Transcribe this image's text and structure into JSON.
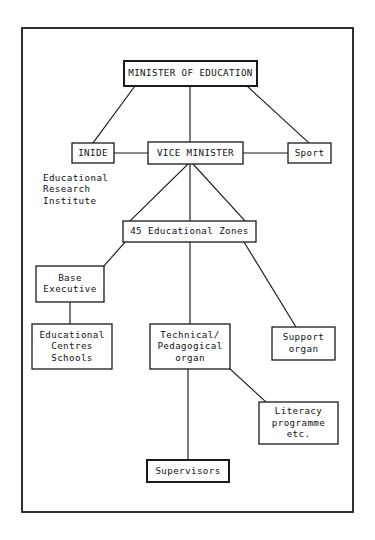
{
  "diagram": {
    "frame": {
      "x": 22,
      "y": 28,
      "width": 331,
      "height": 484
    },
    "colors": {
      "background": "#ffffff",
      "line": "#1a1a1a",
      "text": "#111111",
      "box_fill": "#ffffff"
    },
    "nodes": [
      {
        "id": "minister",
        "name": "minister-of-education",
        "lines": [
          "MINISTER OF EDUCATION"
        ],
        "box": {
          "x": 124,
          "y": 61,
          "width": 133,
          "height": 25
        },
        "weight": "heavy"
      },
      {
        "id": "inide",
        "name": "inide",
        "lines": [
          "INIDE"
        ],
        "box": {
          "x": 72,
          "y": 143,
          "width": 42,
          "height": 20
        },
        "weight": "normal"
      },
      {
        "id": "vice-minister",
        "name": "vice-minister",
        "lines": [
          "VICE MINISTER"
        ],
        "box": {
          "x": 148,
          "y": 142,
          "width": 95,
          "height": 22
        },
        "weight": "normal"
      },
      {
        "id": "sport",
        "name": "sport",
        "lines": [
          "Sport"
        ],
        "box": {
          "x": 288,
          "y": 143,
          "width": 43,
          "height": 20
        },
        "weight": "normal"
      },
      {
        "id": "zones",
        "name": "educational-zones",
        "lines": [
          "45 Educational Zones"
        ],
        "box": {
          "x": 123,
          "y": 221,
          "width": 133,
          "height": 21
        },
        "weight": "normal"
      },
      {
        "id": "base-executive",
        "name": "base-executive",
        "lines": [
          "Base",
          "Executive"
        ],
        "box": {
          "x": 36,
          "y": 266,
          "width": 68,
          "height": 36
        },
        "weight": "normal"
      },
      {
        "id": "educational-centres",
        "name": "educational-centres-schools",
        "lines": [
          "Educational",
          "Centres",
          "Schools"
        ],
        "box": {
          "x": 32,
          "y": 324,
          "width": 80,
          "height": 45
        },
        "weight": "normal"
      },
      {
        "id": "technical-pedagogical",
        "name": "technical-pedagogical-organ",
        "lines": [
          "Technical/",
          "Pedagogical",
          "organ"
        ],
        "box": {
          "x": 150,
          "y": 324,
          "width": 80,
          "height": 45
        },
        "weight": "normal"
      },
      {
        "id": "support-organ",
        "name": "support-organ",
        "lines": [
          "Support",
          "organ"
        ],
        "box": {
          "x": 272,
          "y": 327,
          "width": 63,
          "height": 33
        },
        "weight": "normal"
      },
      {
        "id": "literacy",
        "name": "literacy-programme",
        "lines": [
          "Literacy",
          "programme",
          "etc."
        ],
        "box": {
          "x": 259,
          "y": 402,
          "width": 79,
          "height": 42
        },
        "weight": "normal"
      },
      {
        "id": "supervisors",
        "name": "supervisors",
        "lines": [
          "Supervisors"
        ],
        "box": {
          "x": 147,
          "y": 460,
          "width": 82,
          "height": 22
        },
        "weight": "heavy"
      }
    ],
    "captions": [
      {
        "id": "inide-caption",
        "name": "inide-expansion-caption",
        "lines": [
          "Educational",
          "Research",
          "Institute"
        ],
        "x": 43,
        "y": 178
      }
    ],
    "connectors": [
      {
        "id": "minister-inide",
        "name": "connector-minister-to-inide",
        "points": "[[135,86],[93,143]]"
      },
      {
        "id": "minister-vice",
        "name": "connector-minister-to-vice-minister",
        "points": "[[190,86],[190,142]]"
      },
      {
        "id": "minister-sport",
        "name": "connector-minister-to-sport",
        "points": "[[247,86],[309,143]]"
      },
      {
        "id": "inide-vice",
        "name": "connector-inide-to-vice-minister",
        "points": "[[114,153],[148,153]]"
      },
      {
        "id": "vice-sport",
        "name": "connector-vice-minister-to-sport",
        "points": "[[243,153],[288,153]]"
      },
      {
        "id": "vice-zones-left",
        "name": "connector-vice-minister-to-zones-left",
        "points": "[[188,164],[130,221]]"
      },
      {
        "id": "vice-zones-mid",
        "name": "connector-vice-minister-to-zones-center",
        "points": "[[190,164],[190,221]]"
      },
      {
        "id": "vice-zones-right",
        "name": "connector-vice-minister-to-zones-right",
        "points": "[[193,164],[245,221]]"
      },
      {
        "id": "zones-base",
        "name": "connector-zones-to-base-executive",
        "points": "[[125,242],[104,266]]"
      },
      {
        "id": "zones-technical",
        "name": "connector-zones-to-technical-organ",
        "points": "[[190,242],[190,324]]"
      },
      {
        "id": "zones-support",
        "name": "connector-zones-to-support-organ",
        "points": "[[244,242],[296,327]]"
      },
      {
        "id": "base-centres",
        "name": "connector-base-executive-to-centres",
        "points": "[[70,302],[70,324]]"
      },
      {
        "id": "technical-literacy",
        "name": "connector-technical-organ-to-literacy",
        "points": "[[230,369],[266,402]]"
      },
      {
        "id": "technical-supervisors",
        "name": "connector-technical-organ-to-supervisors",
        "points": "[[188,369],[188,460]]"
      }
    ]
  }
}
